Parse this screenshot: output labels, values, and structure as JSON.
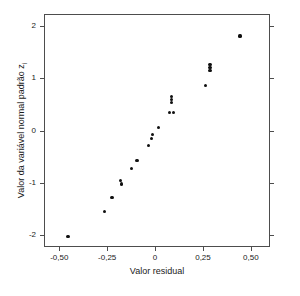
{
  "chart_data": {
    "type": "scatter",
    "title": "",
    "xlabel": "Valor residual",
    "ylabel": "Valor da variável normal padrão z",
    "ylabel_subscript": "i",
    "xlim": [
      -0.58,
      0.6
    ],
    "ylim": [
      -2.22,
      2.22
    ],
    "xticks": [
      -0.5,
      -0.25,
      0,
      0.25,
      0.5
    ],
    "xticklabels": [
      "-0,50",
      "-0,25",
      "0",
      "0,25",
      "0,50"
    ],
    "yticks": [
      -2,
      -1,
      0,
      1,
      2
    ],
    "yticklabels": [
      "-2",
      "-1",
      "0",
      "1",
      "2"
    ],
    "grid": false,
    "legend": false,
    "marker": "filled-circle",
    "marker_color": "#101010",
    "frame_color": "#4d4d4d",
    "background": "#ffffff",
    "n_points": 22,
    "x": [
      -0.46,
      -0.27,
      -0.23,
      -0.18,
      -0.18,
      -0.13,
      -0.1,
      -0.04,
      -0.02,
      -0.02,
      0.01,
      0.07,
      0.09,
      0.08,
      0.08,
      0.08,
      0.26,
      0.28,
      0.28,
      0.28,
      0.44
    ],
    "y": [
      -2.0,
      -1.53,
      -1.26,
      -0.93,
      -1.0,
      -0.7,
      -0.55,
      -0.27,
      -0.07,
      -0.13,
      0.08,
      0.36,
      0.36,
      0.57,
      0.61,
      0.65,
      0.88,
      1.18,
      1.22,
      1.26,
      1.82
    ],
    "points": [
      {
        "x": -0.46,
        "y": -2.0
      },
      {
        "x": -0.27,
        "y": -1.53
      },
      {
        "x": -0.23,
        "y": -1.26
      },
      {
        "x": -0.185,
        "y": -0.93
      },
      {
        "x": -0.18,
        "y": -1.0
      },
      {
        "x": -0.13,
        "y": -0.7
      },
      {
        "x": -0.1,
        "y": -0.55
      },
      {
        "x": -0.04,
        "y": -0.27
      },
      {
        "x": -0.018,
        "y": -0.06
      },
      {
        "x": -0.022,
        "y": -0.13
      },
      {
        "x": 0.012,
        "y": 0.08
      },
      {
        "x": 0.068,
        "y": 0.36
      },
      {
        "x": 0.092,
        "y": 0.36
      },
      {
        "x": 0.082,
        "y": 0.56
      },
      {
        "x": 0.082,
        "y": 0.61
      },
      {
        "x": 0.082,
        "y": 0.66
      },
      {
        "x": 0.258,
        "y": 0.88
      },
      {
        "x": 0.282,
        "y": 1.17
      },
      {
        "x": 0.282,
        "y": 1.22
      },
      {
        "x": 0.282,
        "y": 1.27
      },
      {
        "x": 0.438,
        "y": 1.82
      }
    ]
  }
}
